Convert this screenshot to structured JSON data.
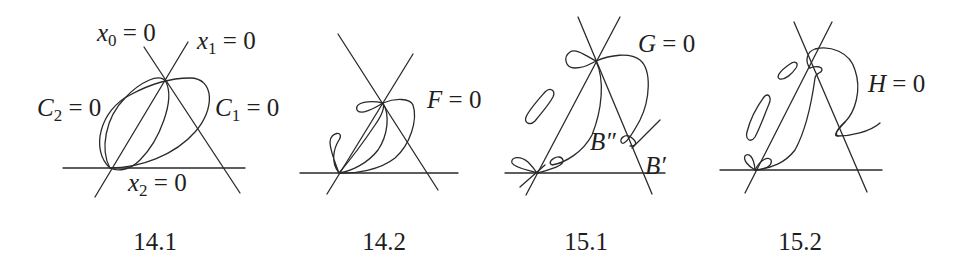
{
  "figures": [
    {
      "caption": "14.1",
      "labels": {
        "x0": {
          "var": "x",
          "sub": "0",
          "rhs": " = 0"
        },
        "x1": {
          "var": "x",
          "sub": "1",
          "rhs": " = 0"
        },
        "x2": {
          "var": "x",
          "sub": "2",
          "rhs": " = 0"
        },
        "c2": {
          "var": "C",
          "sub": "2",
          "rhs": " = 0"
        },
        "c1": {
          "var": "C",
          "sub": "1",
          "rhs": " = 0"
        }
      }
    },
    {
      "caption": "14.2",
      "labels": {
        "f": {
          "var": "F",
          "rhs": " = 0"
        }
      }
    },
    {
      "caption": "15.1",
      "labels": {
        "g": {
          "var": "G",
          "rhs": " = 0"
        },
        "b2": {
          "var": "B″"
        },
        "b1": {
          "var": "B′"
        }
      }
    },
    {
      "caption": "15.2",
      "labels": {
        "h": {
          "var": "H",
          "rhs": " = 0"
        }
      }
    }
  ],
  "colors": {
    "ink": "#2a2a2a",
    "background": "#ffffff"
  }
}
